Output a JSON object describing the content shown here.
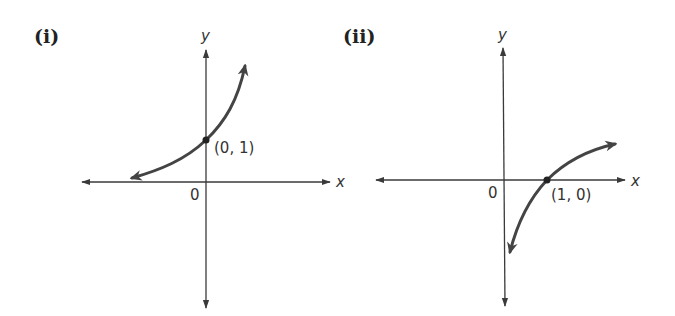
{
  "graphs": [
    {
      "panel_label": "(i)",
      "x_axis_label": "x",
      "y_axis_label": "y",
      "origin_label": "0",
      "point_label": "(0, 1)",
      "curve_type": "exponential growth",
      "key_point": {
        "x": 0,
        "y": 1
      }
    },
    {
      "panel_label": "(ii)",
      "x_axis_label": "x",
      "y_axis_label": "y",
      "origin_label": "0",
      "point_label": "(1, 0)",
      "curve_type": "logarithmic",
      "key_point": {
        "x": 1,
        "y": 0
      }
    }
  ],
  "colors": {
    "axis": "#3a3a3a",
    "curve": "#444444",
    "text": "#333333"
  }
}
